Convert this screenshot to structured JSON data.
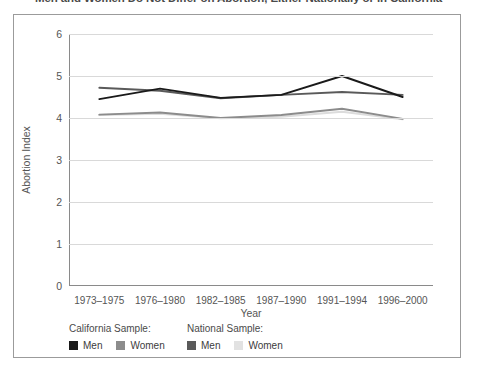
{
  "title": "Men and Women Do Not Differ on Abortion, Either Nationally or in California",
  "chart_data": {
    "type": "line",
    "title": "Men and Women Do Not Differ on Abortion, Either Nationally or in California",
    "xlabel": "Year",
    "ylabel": "Abortion Index",
    "categories": [
      "1973–1975",
      "1976–1980",
      "1982–1985",
      "1987–1990",
      "1991–1994",
      "1996–2000"
    ],
    "ylim": [
      0,
      6
    ],
    "yticks": [
      0,
      1,
      2,
      3,
      4,
      5,
      6
    ],
    "grid": true,
    "legend_position": "bottom-left",
    "series": [
      {
        "name": "Men",
        "group": "California Sample",
        "color": "#1a1a1a",
        "values": [
          4.45,
          4.7,
          4.48,
          4.55,
          5.0,
          4.5
        ]
      },
      {
        "name": "Women",
        "group": "California Sample",
        "color": "#8c8c8c",
        "values": [
          4.08,
          4.13,
          4.0,
          4.07,
          4.22,
          3.98
        ]
      },
      {
        "name": "Men",
        "group": "National Sample",
        "color": "#5a5a5a",
        "values": [
          4.72,
          4.65,
          4.47,
          4.55,
          4.62,
          4.55
        ]
      },
      {
        "name": "Women",
        "group": "National Sample",
        "color": "#dcdcdc",
        "values": [
          4.07,
          4.1,
          3.99,
          4.03,
          4.15,
          3.97
        ]
      }
    ]
  },
  "legend": {
    "groups": [
      {
        "heading": "California Sample:",
        "items": [
          {
            "label": "Men",
            "color": "#1a1a1a"
          },
          {
            "label": "Women",
            "color": "#8c8c8c"
          }
        ]
      },
      {
        "heading": "National Sample:",
        "items": [
          {
            "label": "Men",
            "color": "#5a5a5a"
          },
          {
            "label": "Women",
            "color": "#e2e2e2"
          }
        ]
      }
    ]
  }
}
